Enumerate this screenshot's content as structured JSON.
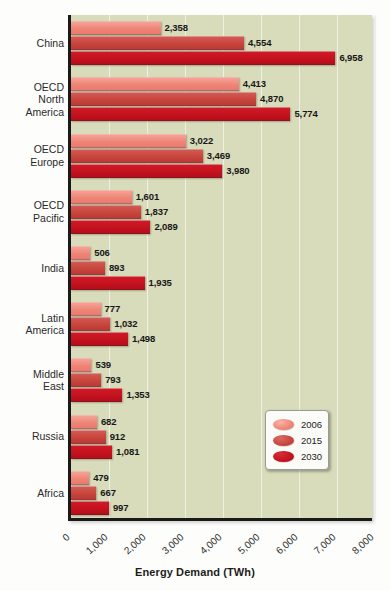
{
  "chart_data": {
    "type": "bar",
    "orientation": "horizontal",
    "title": "",
    "xlabel": "Energy Demand (TWh)",
    "ylabel": "",
    "xlim": [
      0,
      8000
    ],
    "xticks": [
      "0",
      "1,000",
      "2,000",
      "3,000",
      "4,000",
      "5,000",
      "6,000",
      "7,000",
      "8,000"
    ],
    "xtick_values": [
      0,
      1000,
      2000,
      3000,
      4000,
      5000,
      6000,
      7000,
      8000
    ],
    "grid": true,
    "grid_axis": "x",
    "legend_position": "center-right-inside",
    "categories": [
      "China",
      "OECD\nNorth\nAmerica",
      "OECD\nEurope",
      "OECD\nPacific",
      "India",
      "Latin\nAmerica",
      "Middle\nEast",
      "Russia",
      "Africa"
    ],
    "series": [
      {
        "name": "2006",
        "color": "#ef8577",
        "values": [
          2358,
          4413,
          3022,
          1601,
          506,
          777,
          539,
          682,
          479
        ],
        "labels": [
          "2,358",
          "4,413",
          "3,022",
          "1,601",
          "506",
          "777",
          "539",
          "682",
          "479"
        ]
      },
      {
        "name": "2015",
        "color": "#c8453d",
        "values": [
          4554,
          4870,
          3469,
          1837,
          893,
          1032,
          793,
          912,
          667
        ],
        "labels": [
          "4,554",
          "4,870",
          "3,469",
          "1,837",
          "893",
          "1,032",
          "793",
          "912",
          "667"
        ]
      },
      {
        "name": "2030",
        "color": "#c4121f",
        "values": [
          6958,
          5774,
          3980,
          2089,
          1935,
          1498,
          1353,
          1081,
          997
        ],
        "labels": [
          "6,958",
          "5,774",
          "3,980",
          "2,089",
          "1,935",
          "1,498",
          "1,353",
          "1,081",
          "997"
        ]
      }
    ],
    "plot_background_color": "#d8dcba",
    "axis_color": "#1a1a1a"
  },
  "legend": {
    "items": [
      {
        "label": "2006",
        "color": "#ef8577"
      },
      {
        "label": "2015",
        "color": "#c8453d"
      },
      {
        "label": "2030",
        "color": "#c4121f"
      }
    ]
  }
}
